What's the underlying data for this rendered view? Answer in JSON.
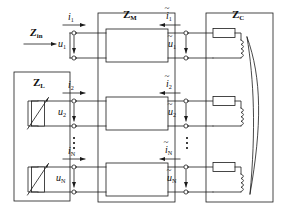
{
  "figure": {
    "type": "circuit-schematic",
    "background": "#ffffff",
    "line_color": "#1a1a1a",
    "port_count_label": "N"
  },
  "blocks": {
    "z_in": {
      "label": "Z",
      "sub": "in",
      "kind": "input-impedance-arrow"
    },
    "z_l": {
      "label": "Z",
      "sub": "L",
      "kind": "load-block",
      "element": "variable-resistor",
      "element_count": 2
    },
    "z_m": {
      "label": "Z",
      "sub": "M",
      "kind": "two-port-network-block",
      "inner_boxes": 3
    },
    "z_c": {
      "label": "Z",
      "sub": "C",
      "kind": "coupled-coil-block",
      "branches": 3,
      "branch_elements": [
        "resistor",
        "inductor"
      ],
      "coupling": "magnetic-core-curve"
    }
  },
  "ports": [
    {
      "index": "1",
      "left_current": {
        "base": "i",
        "sub": "1",
        "tilde": false,
        "direction": "right"
      },
      "left_voltage": {
        "base": "u",
        "sub": "1",
        "tilde": false,
        "direction": "down"
      },
      "right_current": {
        "base": "i",
        "sub": "1",
        "tilde": true,
        "direction": "left"
      },
      "right_voltage": {
        "base": "u",
        "sub": "1",
        "tilde": true,
        "direction": "down"
      }
    },
    {
      "index": "2",
      "left_current": {
        "base": "i",
        "sub": "2",
        "tilde": false,
        "direction": "right"
      },
      "left_voltage": {
        "base": "u",
        "sub": "2",
        "tilde": false,
        "direction": "down"
      },
      "right_current": {
        "base": "i",
        "sub": "2",
        "tilde": true,
        "direction": "left"
      },
      "right_voltage": {
        "base": "u",
        "sub": "2",
        "tilde": true,
        "direction": "down"
      }
    },
    {
      "index": "N",
      "left_current": {
        "base": "i",
        "sub": "N",
        "tilde": false,
        "direction": "right"
      },
      "left_voltage": {
        "base": "u",
        "sub": "N",
        "tilde": false,
        "direction": "down"
      },
      "right_current": {
        "base": "i",
        "sub": "N",
        "tilde": true,
        "direction": "left"
      },
      "right_voltage": {
        "base": "u",
        "sub": "N",
        "tilde": true,
        "direction": "down"
      }
    }
  ],
  "ellipsis": {
    "glyph": "⋮",
    "count": 2,
    "meaning": "ports 3 through N-1 omitted"
  }
}
